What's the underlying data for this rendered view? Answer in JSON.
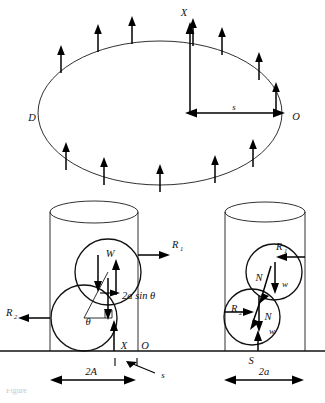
{
  "figure": {
    "type": "free-body-diagram",
    "background_color": "#ffffff",
    "line_color": "#111111",
    "caption_partial": "Figure"
  },
  "plan_view": {
    "name": "ellipse-plan-view",
    "shape": "ellipse",
    "labels": {
      "axis_x": "X",
      "point_left": "D",
      "point_right": "O",
      "offset": "s"
    },
    "arrow_count_top": 9,
    "arrow_count_bottom": 5,
    "description": "Ellipse in plan with upward distributed force arrows around perimeter"
  },
  "left_elevation": {
    "name": "left-cylinder-elevation",
    "labels": {
      "weight": "W",
      "reaction_top": "R",
      "reaction_top_sub": "1",
      "reaction_bottom": "R",
      "reaction_bottom_sub": "2",
      "lever_arm": "2a sin θ",
      "lever_arm_italic_part": "a",
      "angle": "θ",
      "axis_x": "X",
      "origin": "O",
      "width_dim": "2A",
      "offset_dim": "s"
    },
    "circles": 2
  },
  "right_elevation": {
    "name": "right-cylinder-elevation",
    "labels": {
      "reaction_top": "R",
      "reaction_top_sub": "1",
      "reaction_bottom": "R",
      "reaction_bottom_sub": "2",
      "normal_upper": "N",
      "normal_lower": "N",
      "weight_upper": "w",
      "weight_lower": "w",
      "support": "S",
      "width_dim": "2a"
    },
    "circles": 2
  }
}
